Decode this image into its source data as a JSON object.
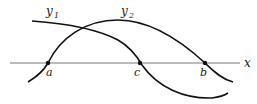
{
  "diagram": {
    "axis": {
      "label": "x"
    },
    "curves": [
      {
        "name": "y1",
        "label_main": "y",
        "label_sub": "1"
      },
      {
        "name": "y2",
        "label_main": "y",
        "label_sub": "2"
      }
    ],
    "points": [
      {
        "label": "a"
      },
      {
        "label": "c"
      },
      {
        "label": "b"
      }
    ],
    "colors": {
      "stroke": "#111111",
      "axis": "#555555",
      "background": "#ffffff"
    }
  }
}
